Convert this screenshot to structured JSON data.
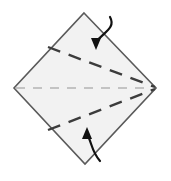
{
  "figure": {
    "title": "Origami fold step diagram",
    "background_color": "#ffffff"
  },
  "shape": {
    "name": "diamond",
    "kind": "square-rotated-45",
    "fill_color": "#f2f2f2",
    "stroke_color": "#5a5a5a",
    "stroke_width": 1.6,
    "vertices": {
      "top": {
        "x": 84,
        "y": 13
      },
      "right": {
        "x": 156,
        "y": 88
      },
      "bottom": {
        "x": 85,
        "y": 164
      },
      "left": {
        "x": 14,
        "y": 88
      }
    },
    "points_attr": "84,13 156,88 85,164 14,88"
  },
  "fold_lines": [
    {
      "name": "center-axis",
      "label": "horizontal center axis",
      "style": "dashed",
      "color": "#b4b4b4",
      "width": 1.5,
      "dash": "9 8",
      "x1": 16,
      "y1": 88,
      "x2": 152,
      "y2": 88
    },
    {
      "name": "upper-valley-fold",
      "label": "upper valley fold",
      "style": "dashed",
      "color": "#3c3c3c",
      "width": 2.4,
      "dash": "13 9",
      "x1": 48,
      "y1": 47,
      "x2": 155,
      "y2": 87
    },
    {
      "name": "lower-valley-fold",
      "label": "lower valley fold",
      "style": "dashed",
      "color": "#3c3c3c",
      "width": 2.4,
      "dash": "13 9",
      "x1": 48,
      "y1": 130,
      "x2": 155,
      "y2": 89
    }
  ],
  "arrows": [
    {
      "name": "fold-down-arrow",
      "label": "fold upper edge down",
      "color": "#111111",
      "width": 2.2,
      "path": "M 110 17 C 116 28 104 32 96 42",
      "head_points": "96,50 91,38 101,38"
    },
    {
      "name": "fold-up-arrow",
      "label": "fold lower edge up",
      "color": "#111111",
      "width": 2.2,
      "path": "M 100 161 C 92 152 92 144 88 136",
      "head_points": "87,127 82,139 92,139"
    }
  ]
}
